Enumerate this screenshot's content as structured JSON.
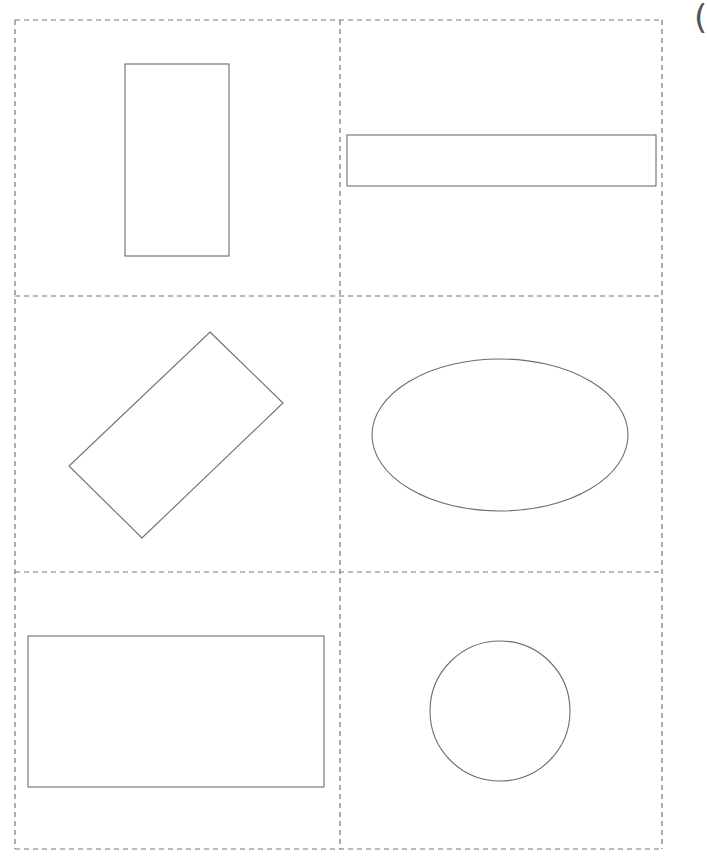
{
  "page": {
    "background": "#ffffff",
    "edge_glyph": "("
  },
  "grid": {
    "stroke": "#777777",
    "dash": "5 4",
    "left": 15,
    "right": 662,
    "top": 20,
    "bottom": 849,
    "col_divider_x": 340,
    "row_divider_ys": [
      296,
      572
    ]
  },
  "shapes": {
    "stroke": "#6e6e6e",
    "items": [
      {
        "id": "tall-rectangle",
        "type": "rect",
        "x": 125,
        "y": 64,
        "w": 104,
        "h": 192
      },
      {
        "id": "wide-thin-rectangle",
        "type": "rect",
        "x": 347,
        "y": 135,
        "w": 309,
        "h": 51
      },
      {
        "id": "rotated-rectangle",
        "type": "polygon",
        "points": "210,332 283,403 142,538 69,466"
      },
      {
        "id": "ellipse",
        "type": "ellipse",
        "cx": 500,
        "cy": 435,
        "rx": 128,
        "ry": 76
      },
      {
        "id": "large-rectangle",
        "type": "rect",
        "x": 28,
        "y": 636,
        "w": 296,
        "h": 151
      },
      {
        "id": "circle",
        "type": "circle",
        "cx": 500,
        "cy": 711,
        "r": 70
      }
    ]
  }
}
